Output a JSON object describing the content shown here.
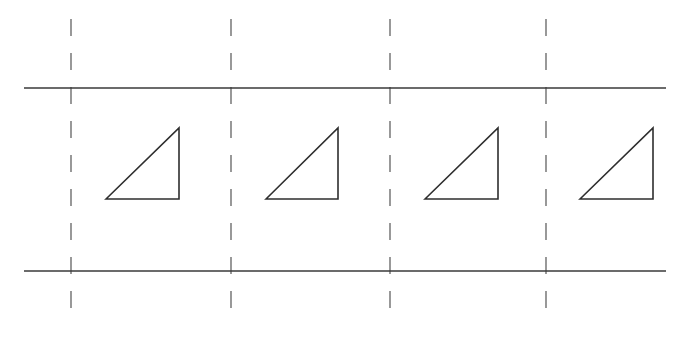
{
  "canvas": {
    "width": 681,
    "height": 338,
    "background": "#ffffff"
  },
  "colors": {
    "solid_line": "#3a3a3a",
    "dashed_line": "#555555",
    "triangle_stroke": "#2e2e2e"
  },
  "horizontal_lines": [
    {
      "id": "top-rail",
      "y": 88,
      "x1": 24,
      "x2": 666
    },
    {
      "id": "bottom-rail",
      "y": 271,
      "x1": 24,
      "x2": 666
    }
  ],
  "vertical_dashed_lines": [
    {
      "id": "column-divider-1",
      "x": 71,
      "y1": 19,
      "y2": 318
    },
    {
      "id": "column-divider-2",
      "x": 231,
      "y1": 19,
      "y2": 318
    },
    {
      "id": "column-divider-3",
      "x": 390,
      "y1": 19,
      "y2": 318
    },
    {
      "id": "column-divider-4",
      "x": 546,
      "y1": 19,
      "y2": 318
    }
  ],
  "dash_pattern": {
    "dash": 17,
    "gap": 17
  },
  "triangles": [
    {
      "id": "triangle-1",
      "points": [
        [
          106,
          199
        ],
        [
          179,
          128
        ],
        [
          179,
          199
        ]
      ]
    },
    {
      "id": "triangle-2",
      "points": [
        [
          266,
          199
        ],
        [
          338,
          128
        ],
        [
          338,
          199
        ]
      ]
    },
    {
      "id": "triangle-3",
      "points": [
        [
          425,
          199
        ],
        [
          498,
          128
        ],
        [
          498,
          199
        ]
      ]
    },
    {
      "id": "triangle-4",
      "points": [
        [
          580,
          199
        ],
        [
          653,
          128
        ],
        [
          653,
          199
        ]
      ]
    }
  ]
}
